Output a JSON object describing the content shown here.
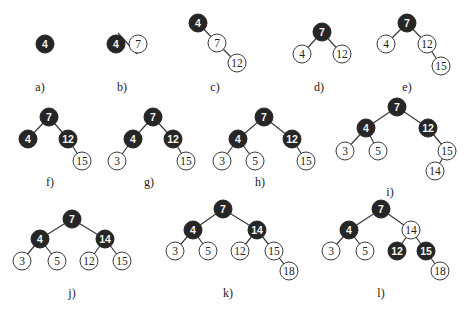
{
  "figure": {
    "node_radius": 9,
    "colors": {
      "black_node": "#262626",
      "white_node": "#ffffff",
      "edge": "#3a3a3a"
    },
    "panels": [
      {
        "label": "a)",
        "label_pos": [
          40,
          91
        ],
        "nodes": [
          {
            "key": "4",
            "color": "black",
            "x": 45,
            "y": 44
          }
        ],
        "edges": []
      },
      {
        "label": "b)",
        "label_pos": [
          122,
          91
        ],
        "nodes": [
          {
            "key": "4",
            "color": "black",
            "x": 116,
            "y": 44
          },
          {
            "key": "7",
            "color": "white",
            "x": 138,
            "y": 44
          }
        ],
        "edges": [],
        "strike_line": [
          118,
          33,
          137,
          54
        ]
      },
      {
        "label": "c)",
        "label_pos": [
          215,
          91
        ],
        "nodes": [
          {
            "key": "4",
            "color": "black",
            "x": 198,
            "y": 23
          },
          {
            "key": "7",
            "color": "white",
            "x": 217,
            "y": 43
          },
          {
            "key": "12",
            "color": "white",
            "x": 237,
            "y": 63
          }
        ],
        "edges": [
          [
            0,
            1
          ],
          [
            1,
            2
          ]
        ]
      },
      {
        "label": "d)",
        "label_pos": [
          319,
          91
        ],
        "nodes": [
          {
            "key": "7",
            "color": "black",
            "x": 322,
            "y": 32
          },
          {
            "key": "4",
            "color": "white",
            "x": 302,
            "y": 54
          },
          {
            "key": "12",
            "color": "white",
            "x": 342,
            "y": 54
          }
        ],
        "edges": [
          [
            0,
            1
          ],
          [
            0,
            2
          ]
        ]
      },
      {
        "label": "e)",
        "label_pos": [
          407,
          91
        ],
        "nodes": [
          {
            "key": "7",
            "color": "black",
            "x": 407,
            "y": 23
          },
          {
            "key": "4",
            "color": "white",
            "x": 386,
            "y": 44
          },
          {
            "key": "12",
            "color": "white",
            "x": 427,
            "y": 44
          },
          {
            "key": "15",
            "color": "white",
            "x": 441,
            "y": 66
          }
        ],
        "edges": [
          [
            0,
            1
          ],
          [
            0,
            2
          ],
          [
            2,
            3
          ]
        ]
      },
      {
        "label": "f)",
        "label_pos": [
          50,
          186
        ],
        "nodes": [
          {
            "key": "7",
            "color": "black",
            "x": 49,
            "y": 117
          },
          {
            "key": "4",
            "color": "black",
            "x": 28,
            "y": 139
          },
          {
            "key": "12",
            "color": "black",
            "x": 68,
            "y": 139
          },
          {
            "key": "15",
            "color": "white",
            "x": 82,
            "y": 161
          }
        ],
        "edges": [
          [
            0,
            1
          ],
          [
            0,
            2
          ],
          [
            2,
            3
          ]
        ]
      },
      {
        "label": "g)",
        "label_pos": [
          149,
          186
        ],
        "nodes": [
          {
            "key": "7",
            "color": "black",
            "x": 153,
            "y": 117
          },
          {
            "key": "4",
            "color": "black",
            "x": 133,
            "y": 139
          },
          {
            "key": "12",
            "color": "black",
            "x": 173,
            "y": 139
          },
          {
            "key": "3",
            "color": "white",
            "x": 117,
            "y": 161
          },
          {
            "key": "15",
            "color": "white",
            "x": 186,
            "y": 161
          }
        ],
        "edges": [
          [
            0,
            1
          ],
          [
            0,
            2
          ],
          [
            1,
            3
          ],
          [
            2,
            4
          ]
        ]
      },
      {
        "label": "h)",
        "label_pos": [
          260,
          186
        ],
        "nodes": [
          {
            "key": "7",
            "color": "black",
            "x": 264,
            "y": 117
          },
          {
            "key": "4",
            "color": "black",
            "x": 238,
            "y": 139
          },
          {
            "key": "12",
            "color": "black",
            "x": 292,
            "y": 139
          },
          {
            "key": "3",
            "color": "white",
            "x": 222,
            "y": 161
          },
          {
            "key": "5",
            "color": "white",
            "x": 255,
            "y": 161
          },
          {
            "key": "15",
            "color": "white",
            "x": 306,
            "y": 161
          }
        ],
        "edges": [
          [
            0,
            1
          ],
          [
            0,
            2
          ],
          [
            1,
            3
          ],
          [
            1,
            4
          ],
          [
            2,
            5
          ]
        ]
      },
      {
        "label": "i)",
        "label_pos": [
          390,
          196
        ],
        "nodes": [
          {
            "key": "7",
            "color": "black",
            "x": 397,
            "y": 107
          },
          {
            "key": "4",
            "color": "black",
            "x": 366,
            "y": 128
          },
          {
            "key": "12",
            "color": "black",
            "x": 428,
            "y": 128
          },
          {
            "key": "3",
            "color": "white",
            "x": 345,
            "y": 151
          },
          {
            "key": "5",
            "color": "white",
            "x": 378,
            "y": 151
          },
          {
            "key": "15",
            "color": "white",
            "x": 447,
            "y": 151
          },
          {
            "key": "14",
            "color": "white",
            "x": 435,
            "y": 171
          }
        ],
        "edges": [
          [
            0,
            1
          ],
          [
            0,
            2
          ],
          [
            1,
            3
          ],
          [
            1,
            4
          ],
          [
            2,
            5
          ],
          [
            5,
            6
          ]
        ]
      },
      {
        "label": "j)",
        "label_pos": [
          72,
          297
        ],
        "nodes": [
          {
            "key": "7",
            "color": "black",
            "x": 72,
            "y": 219
          },
          {
            "key": "4",
            "color": "black",
            "x": 40,
            "y": 239
          },
          {
            "key": "14",
            "color": "black",
            "x": 105,
            "y": 239
          },
          {
            "key": "3",
            "color": "white",
            "x": 22,
            "y": 261
          },
          {
            "key": "5",
            "color": "white",
            "x": 57,
            "y": 261
          },
          {
            "key": "12",
            "color": "white",
            "x": 89,
            "y": 261
          },
          {
            "key": "15",
            "color": "white",
            "x": 122,
            "y": 261
          }
        ],
        "edges": [
          [
            0,
            1
          ],
          [
            0,
            2
          ],
          [
            1,
            3
          ],
          [
            1,
            4
          ],
          [
            2,
            5
          ],
          [
            2,
            6
          ]
        ]
      },
      {
        "label": "k)",
        "label_pos": [
          228,
          297
        ],
        "nodes": [
          {
            "key": "7",
            "color": "black",
            "x": 223,
            "y": 209
          },
          {
            "key": "4",
            "color": "black",
            "x": 193,
            "y": 230
          },
          {
            "key": "14",
            "color": "black",
            "x": 257,
            "y": 230
          },
          {
            "key": "3",
            "color": "white",
            "x": 175,
            "y": 251
          },
          {
            "key": "5",
            "color": "white",
            "x": 208,
            "y": 251
          },
          {
            "key": "12",
            "color": "white",
            "x": 240,
            "y": 251
          },
          {
            "key": "15",
            "color": "white",
            "x": 274,
            "y": 251
          },
          {
            "key": "18",
            "color": "white",
            "x": 289,
            "y": 271
          }
        ],
        "edges": [
          [
            0,
            1
          ],
          [
            0,
            2
          ],
          [
            1,
            3
          ],
          [
            1,
            4
          ],
          [
            2,
            5
          ],
          [
            2,
            6
          ],
          [
            6,
            7
          ]
        ]
      },
      {
        "label": "l)",
        "label_pos": [
          381,
          297
        ],
        "nodes": [
          {
            "key": "7",
            "color": "black",
            "x": 381,
            "y": 209
          },
          {
            "key": "4",
            "color": "black",
            "x": 349,
            "y": 230
          },
          {
            "key": "14",
            "color": "white",
            "x": 411,
            "y": 230
          },
          {
            "key": "3",
            "color": "white",
            "x": 331,
            "y": 251
          },
          {
            "key": "5",
            "color": "white",
            "x": 365,
            "y": 251
          },
          {
            "key": "12",
            "color": "black",
            "x": 397,
            "y": 251
          },
          {
            "key": "15",
            "color": "black",
            "x": 426,
            "y": 251
          },
          {
            "key": "18",
            "color": "white",
            "x": 440,
            "y": 271
          }
        ],
        "edges": [
          [
            0,
            1
          ],
          [
            0,
            2
          ],
          [
            1,
            3
          ],
          [
            1,
            4
          ],
          [
            2,
            5
          ],
          [
            2,
            6
          ],
          [
            6,
            7
          ]
        ]
      }
    ]
  }
}
